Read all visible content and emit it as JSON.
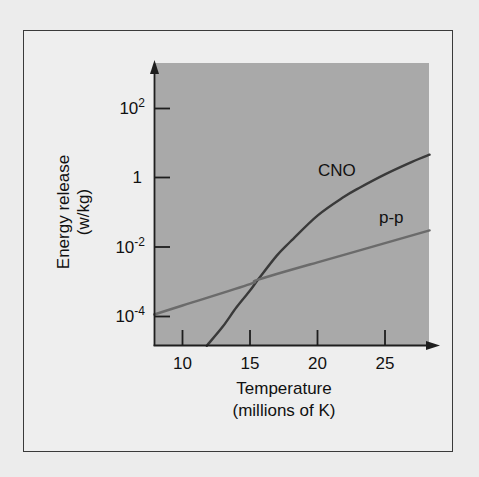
{
  "chart_data": {
    "type": "line",
    "title": "",
    "xlabel": "Temperature (millions of K)",
    "xlabel_lines": [
      "Temperature",
      "(millions of K)"
    ],
    "ylabel": "Energy release (w/kg)",
    "ylabel_lines": [
      "Energy release",
      "(w/kg)"
    ],
    "x_ticks": [
      10,
      15,
      20,
      25
    ],
    "y_ticks": [
      "10^2",
      "1",
      "10^-2",
      "10^-4"
    ],
    "y_scale": "log",
    "xlim": [
      7.9,
      28.3
    ],
    "ylim_log10": [
      -4.86,
      3.4
    ],
    "grid": false,
    "legend": "inline labels",
    "series": [
      {
        "name": "CNO",
        "x": [
          11.8,
          13,
          14,
          15,
          15.6,
          17,
          18,
          20,
          22,
          23,
          25,
          27,
          28.3
        ],
        "log10_y": [
          -4.86,
          -4.3,
          -3.75,
          -3.27,
          -2.95,
          -2.25,
          -1.85,
          -1.1,
          -0.55,
          -0.32,
          0.09,
          0.45,
          0.66
        ],
        "color": "#3a3a3a"
      },
      {
        "name": "p-p",
        "x": [
          7.9,
          10,
          15,
          15.6,
          20,
          25,
          28.3
        ],
        "log10_y": [
          -3.96,
          -3.7,
          -3.08,
          -2.95,
          -2.45,
          -1.9,
          -1.53
        ],
        "color": "#6b6b6b"
      }
    ],
    "annotations": [
      {
        "text": "CNO",
        "x": 20.2,
        "log10_y": 0.2
      },
      {
        "text": "p-p",
        "x": 23.8,
        "log10_y": -1.1
      }
    ]
  },
  "labels": {
    "y_tick_base": "10",
    "y_ticks": [
      {
        "base": "10",
        "exp": "2",
        "plain": ""
      },
      {
        "base": "",
        "exp": "",
        "plain": "1"
      },
      {
        "base": "10",
        "exp": "-2",
        "plain": ""
      },
      {
        "base": "10",
        "exp": "-4",
        "plain": ""
      }
    ],
    "x_ticks": [
      "10",
      "15",
      "20",
      "25"
    ],
    "x_title_1": "Temperature",
    "x_title_2": "(millions of K)",
    "y_title_1": "Energy release",
    "y_title_2": "(w/kg)",
    "cno_label": "CNO",
    "pp_label": "p-p"
  },
  "colors": {
    "page_bg": "#ececec",
    "frame_bg": "#eeeeee",
    "plot_bg": "#a9a9a9",
    "axis": "#1e1e1e",
    "cno": "#3a3a3a",
    "pp": "#6b6b6b"
  }
}
